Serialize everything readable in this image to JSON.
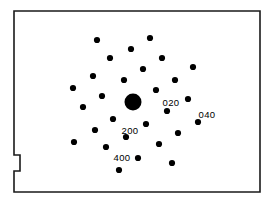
{
  "figure": {
    "type": "diffraction-pattern",
    "width": 273,
    "height": 203,
    "background_color": "#ffffff",
    "frame": {
      "stroke_color": "#1a1a1a",
      "stroke_width": 1.6,
      "left": 14,
      "top": 11,
      "right": 260,
      "bottom": 192,
      "notch": {
        "description": "small rectangular tab on left edge",
        "y_top": 155,
        "y_bottom": 171,
        "depth": 6
      }
    },
    "spot_color": "#000000",
    "label_color": "#000000"
  },
  "chart_data": {
    "type": "scatter",
    "xlabel": "",
    "ylabel": "",
    "xlim": [
      14,
      260
    ],
    "ylim": [
      11,
      192
    ],
    "grid": false,
    "legend": null,
    "annotations": [
      {
        "text": "020",
        "x": 171,
        "y": 103
      },
      {
        "text": "040",
        "x": 207,
        "y": 115
      },
      {
        "text": "200",
        "x": 130,
        "y": 131
      },
      {
        "text": "400",
        "x": 122,
        "y": 158
      }
    ],
    "series": [
      {
        "name": "transmitted-beam",
        "marker": "circle",
        "radius": 8.5,
        "points": [
          {
            "x": 133,
            "y": 102,
            "index": "000"
          }
        ]
      },
      {
        "name": "diffraction-spots",
        "marker": "circle",
        "radius": 3.1,
        "points": [
          {
            "x": 97,
            "y": 40
          },
          {
            "x": 150,
            "y": 38
          },
          {
            "x": 131,
            "y": 49
          },
          {
            "x": 110,
            "y": 58
          },
          {
            "x": 162,
            "y": 58
          },
          {
            "x": 193,
            "y": 67
          },
          {
            "x": 143,
            "y": 69
          },
          {
            "x": 175,
            "y": 80
          },
          {
            "x": 124,
            "y": 80
          },
          {
            "x": 93,
            "y": 76
          },
          {
            "x": 73,
            "y": 88
          },
          {
            "x": 156,
            "y": 90
          },
          {
            "x": 102,
            "y": 96
          },
          {
            "x": 188,
            "y": 99
          },
          {
            "x": 83,
            "y": 107
          },
          {
            "x": 167,
            "y": 111
          },
          {
            "x": 113,
            "y": 119
          },
          {
            "x": 198,
            "y": 122
          },
          {
            "x": 146,
            "y": 124
          },
          {
            "x": 95,
            "y": 130
          },
          {
            "x": 178,
            "y": 133
          },
          {
            "x": 126,
            "y": 137
          },
          {
            "x": 74,
            "y": 142
          },
          {
            "x": 159,
            "y": 144
          },
          {
            "x": 106,
            "y": 147
          },
          {
            "x": 138,
            "y": 158
          },
          {
            "x": 172,
            "y": 163
          },
          {
            "x": 119,
            "y": 170
          }
        ]
      }
    ]
  }
}
